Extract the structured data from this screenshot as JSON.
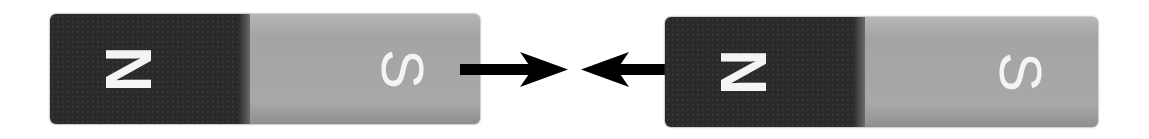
{
  "figure": {
    "magnets": [
      {
        "north_label": "N",
        "south_label": "S"
      },
      {
        "north_label": "N",
        "south_label": "S"
      }
    ],
    "arrows": [
      {
        "direction": "right"
      },
      {
        "direction": "left"
      }
    ],
    "colors": {
      "north_pole": "#2a2a2a",
      "south_pole": "#a9a9a9",
      "arrow": "#000000",
      "label": "#f4f4f4"
    }
  }
}
